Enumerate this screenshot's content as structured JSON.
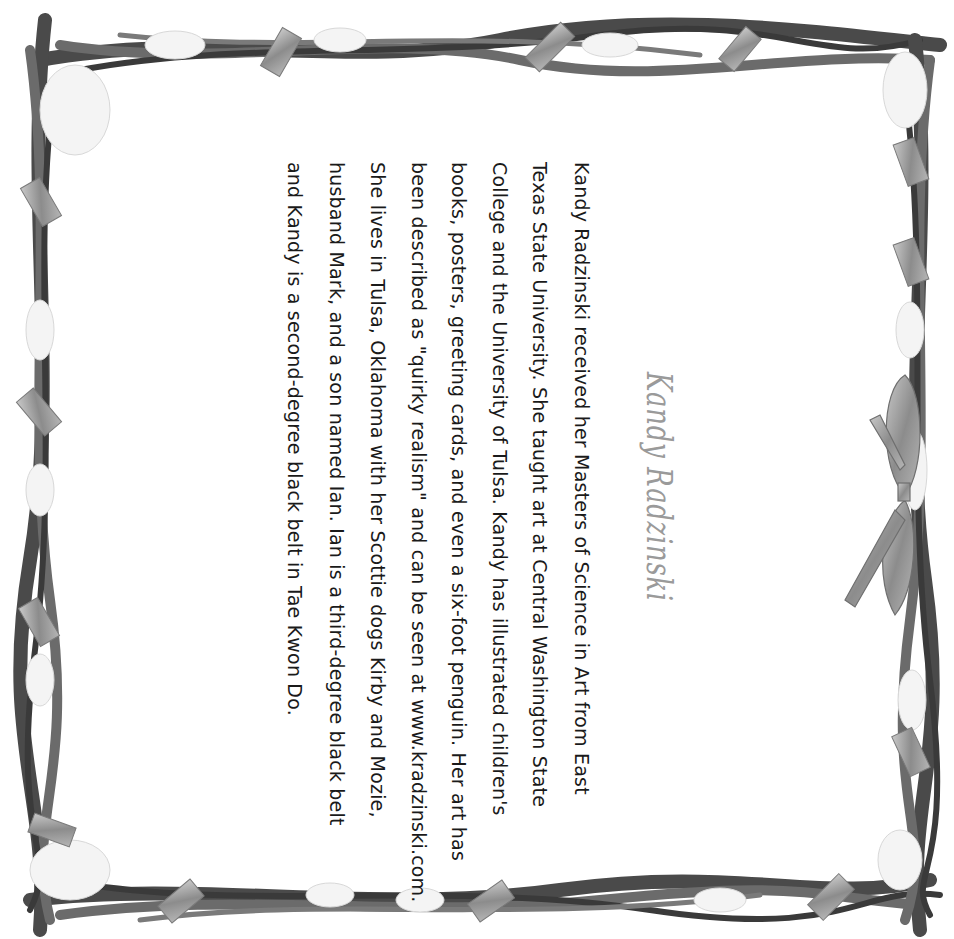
{
  "page": {
    "orientation": "rotated-90-clockwise",
    "background": "#ffffff",
    "text_color": "#1a1a1a",
    "title_color": "#9a9a9a"
  },
  "title": "Kandy Radzinski",
  "bio": {
    "lines": [
      "Kandy Radzinski received her Masters of Science in Art from East",
      "Texas State University. She taught art at Central Washington State",
      "College and the University of Tulsa. Kandy has illustrated children's",
      "books, posters, greeting cards, and even a six-foot penguin. Her art has",
      "been described as \"quirky realism\" and can be seen at www.kradzinski.com.",
      "She lives in Tulsa, Oklahoma with her Scottie dogs Kirby and Mozie,",
      "husband Mark, and a son named Ian. Ian is a third-degree black belt",
      "and Kandy is a second-degree black belt in Tae Kwon Do."
    ]
  },
  "decoration": {
    "frame": "snowy twisted-branch border with ribbons",
    "bow": "ribbon bow on right edge"
  }
}
